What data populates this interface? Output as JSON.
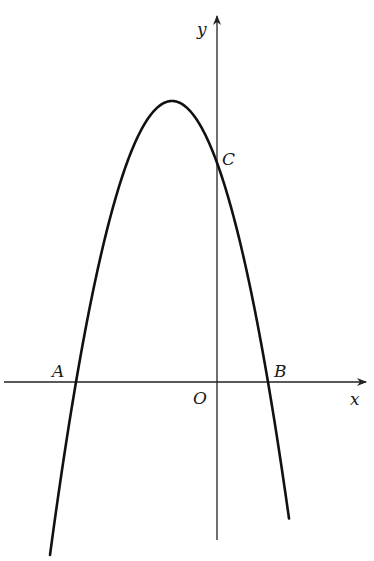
{
  "diagram": {
    "type": "parabola-graph",
    "axes": {
      "x_label": "x",
      "y_label": "y",
      "origin_label": "O",
      "color": "#222222"
    },
    "curve": {
      "description": "downward-opening parabola, vertex left of y-axis",
      "color": "#111111"
    },
    "points": {
      "A": "A",
      "B": "B",
      "C": "C"
    }
  }
}
